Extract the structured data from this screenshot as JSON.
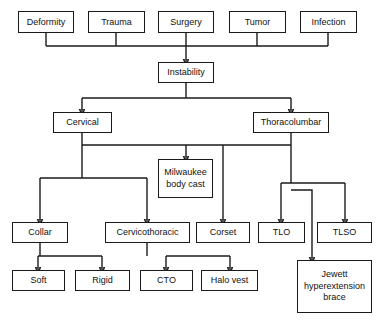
{
  "diagram": {
    "type": "flowchart",
    "colors": {
      "line": "#1a1a1a",
      "box_border": "#1a1a1a",
      "box_fill": "#ffffff",
      "text": "#111111"
    },
    "nodes": [
      {
        "id": "deformity",
        "label": "Deformity",
        "x": 18,
        "y": 11,
        "w": 56,
        "h": 22,
        "level": "cause"
      },
      {
        "id": "trauma",
        "label": "Trauma",
        "x": 88,
        "y": 11,
        "w": 57,
        "h": 22,
        "level": "cause"
      },
      {
        "id": "surgery",
        "label": "Surgery",
        "x": 158,
        "y": 11,
        "w": 56,
        "h": 22,
        "level": "cause"
      },
      {
        "id": "tumor",
        "label": "Tumor",
        "x": 229,
        "y": 11,
        "w": 57,
        "h": 22,
        "level": "cause"
      },
      {
        "id": "infection",
        "label": "Infection",
        "x": 300,
        "y": 11,
        "w": 57,
        "h": 22,
        "level": "cause"
      },
      {
        "id": "instability",
        "label": "Instability",
        "x": 158,
        "y": 62,
        "w": 56,
        "h": 21,
        "level": "condition"
      },
      {
        "id": "cervical",
        "label": "Cervical",
        "x": 53,
        "y": 112,
        "w": 59,
        "h": 21,
        "level": "region"
      },
      {
        "id": "thoracolumbar",
        "label": "Thoracolumbar",
        "x": 253,
        "y": 112,
        "w": 76,
        "h": 21,
        "level": "region"
      },
      {
        "id": "milwaukee",
        "label": "Milwaukee\nbody cast",
        "x": 158,
        "y": 159,
        "w": 55,
        "h": 39,
        "level": "device"
      },
      {
        "id": "collar",
        "label": "Collar",
        "x": 12,
        "y": 222,
        "w": 56,
        "h": 21,
        "level": "device"
      },
      {
        "id": "cervicothoracic",
        "label": "Cervicothoracic",
        "x": 105,
        "y": 222,
        "w": 85,
        "h": 21,
        "level": "device"
      },
      {
        "id": "corset",
        "label": "Corset",
        "x": 196,
        "y": 222,
        "w": 54,
        "h": 21,
        "level": "device"
      },
      {
        "id": "tlo",
        "label": "TLO",
        "x": 258,
        "y": 222,
        "w": 47,
        "h": 21,
        "level": "device"
      },
      {
        "id": "tlso",
        "label": "TLSO",
        "x": 317,
        "y": 222,
        "w": 55,
        "h": 21,
        "level": "device"
      },
      {
        "id": "soft",
        "label": "Soft",
        "x": 12,
        "y": 270,
        "w": 53,
        "h": 21,
        "level": "subtype"
      },
      {
        "id": "rigid",
        "label": "Rigid",
        "x": 75,
        "y": 270,
        "w": 55,
        "h": 21,
        "level": "subtype"
      },
      {
        "id": "cto",
        "label": "CTO",
        "x": 140,
        "y": 270,
        "w": 53,
        "h": 21,
        "level": "subtype"
      },
      {
        "id": "halovest",
        "label": "Halo vest",
        "x": 201,
        "y": 270,
        "w": 57,
        "h": 21,
        "level": "subtype"
      },
      {
        "id": "jewett",
        "label": "Jewett\nhyperextension\nbrace",
        "x": 297,
        "y": 260,
        "w": 75,
        "h": 53,
        "level": "device"
      }
    ],
    "edges": [
      {
        "from": "deformity",
        "to": "instability",
        "type": "bus"
      },
      {
        "from": "trauma",
        "to": "instability",
        "type": "bus"
      },
      {
        "from": "surgery",
        "to": "instability",
        "type": "direct"
      },
      {
        "from": "tumor",
        "to": "instability",
        "type": "bus"
      },
      {
        "from": "infection",
        "to": "instability",
        "type": "bus"
      },
      {
        "from": "instability",
        "to": "cervical",
        "type": "split"
      },
      {
        "from": "instability",
        "to": "thoracolumbar",
        "type": "split"
      },
      {
        "from": "cervical",
        "to": "collar",
        "type": "split"
      },
      {
        "from": "cervical",
        "to": "cervicothoracic",
        "type": "split"
      },
      {
        "from": "cervical",
        "to": "milwaukee",
        "type": "bus"
      },
      {
        "from": "thoracolumbar",
        "to": "milwaukee",
        "type": "bus"
      },
      {
        "from": "thoracolumbar",
        "to": "corset",
        "type": "bus"
      },
      {
        "from": "thoracolumbar",
        "to": "tlo",
        "type": "split"
      },
      {
        "from": "thoracolumbar",
        "to": "tlso",
        "type": "split"
      },
      {
        "from": "thoracolumbar",
        "to": "jewett",
        "type": "routed"
      },
      {
        "from": "collar",
        "to": "soft",
        "type": "split"
      },
      {
        "from": "collar",
        "to": "rigid",
        "type": "split"
      },
      {
        "from": "cervicothoracic",
        "to": "cto",
        "type": "split"
      },
      {
        "from": "cervicothoracic",
        "to": "halovest",
        "type": "split"
      }
    ]
  }
}
